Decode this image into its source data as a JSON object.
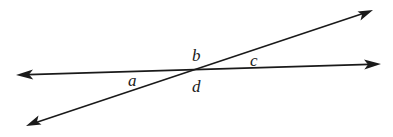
{
  "diagram": {
    "type": "intersecting-lines",
    "stroke_color": "#1a1a1a",
    "background": "#ffffff",
    "lines": [
      {
        "name": "horizontal-line",
        "from": [
          16,
          75
        ],
        "to": [
          381,
          64
        ],
        "arrows": "both"
      },
      {
        "name": "diagonal-line",
        "from": [
          26,
          126
        ],
        "to": [
          373,
          10
        ],
        "arrows": "both"
      }
    ],
    "intersection": [
      186,
      70
    ],
    "labels": [
      {
        "id": "a",
        "text": "a",
        "x": 128,
        "y": 86
      },
      {
        "id": "b",
        "text": "b",
        "x": 192,
        "y": 61
      },
      {
        "id": "c",
        "text": "c",
        "x": 250,
        "y": 66
      },
      {
        "id": "d",
        "text": "d",
        "x": 192,
        "y": 92
      }
    ]
  }
}
